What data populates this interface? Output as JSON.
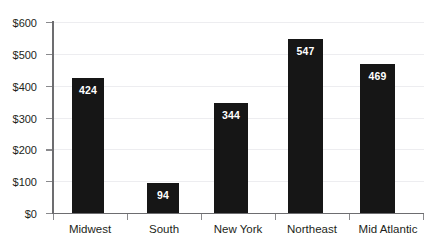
{
  "chart_data": {
    "type": "bar",
    "title": "",
    "subtitle": "",
    "xlabel": "",
    "ylabel": "",
    "categories": [
      "Midwest",
      "South",
      "New York",
      "Northeast",
      "Mid Atlantic"
    ],
    "values": [
      424,
      94,
      344,
      547,
      469
    ],
    "data_labels": [
      "424",
      "94",
      "344",
      "547",
      "469"
    ],
    "ylim": [
      0,
      600
    ],
    "y_ticks": [
      0,
      100,
      200,
      300,
      400,
      500,
      600
    ],
    "y_tick_labels": [
      "$0",
      "$100",
      "$200",
      "$300",
      "$400",
      "$500",
      "$600"
    ],
    "grid": true,
    "legend": false,
    "legend_position": "none",
    "bar_color": "#161616",
    "data_label_color": "#ffffff",
    "axis_color": "#6d6d70",
    "grid_color": "#ededf0",
    "text_color": "#231f20",
    "background_color": "#ffffff"
  }
}
